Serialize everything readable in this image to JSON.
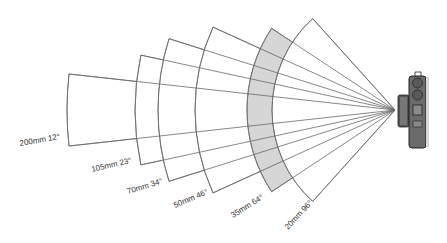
{
  "diagram": {
    "title": "",
    "apex": {
      "x": 395,
      "y": 110
    },
    "stroke_color": "#6a6a6a",
    "shade_color": "#cfcfcf",
    "lenses": [
      {
        "focal": "200mm",
        "angle": "12",
        "label": "200mm 12°",
        "radius": 328,
        "half_angle": 6.3,
        "shaded": false,
        "label_x": 20,
        "label_y": 146,
        "label_rot": -10
      },
      {
        "focal": "105mm",
        "angle": "23",
        "label": "105mm 23°",
        "radius": 260,
        "half_angle": 12.2,
        "shaded": false,
        "label_x": 92,
        "label_y": 172,
        "label_rot": -13
      },
      {
        "focal": "70mm",
        "angle": "34",
        "label": "70mm 34°",
        "radius": 237,
        "half_angle": 17.5,
        "shaded": false,
        "label_x": 128,
        "label_y": 194,
        "label_rot": -17
      },
      {
        "focal": "50mm",
        "angle": "46",
        "label": "50mm 46°",
        "radius": 200,
        "half_angle": 24.5,
        "shaded": false,
        "label_x": 175,
        "label_y": 208,
        "label_rot": -23
      },
      {
        "focal": "35mm",
        "angle": "64",
        "label": "35mm 64°",
        "radius": 148,
        "half_angle": 33.5,
        "shaded": true,
        "label_x": 233,
        "label_y": 218,
        "label_rot": -32
      },
      {
        "focal": "20mm",
        "angle": "96",
        "label": "20mm 96°",
        "radius": 123,
        "half_angle": 48,
        "shaded": false,
        "label_x": 288,
        "label_y": 230,
        "label_rot": -47
      }
    ],
    "camera": {
      "name": "camera-icon",
      "x": 398,
      "y": 73
    }
  }
}
